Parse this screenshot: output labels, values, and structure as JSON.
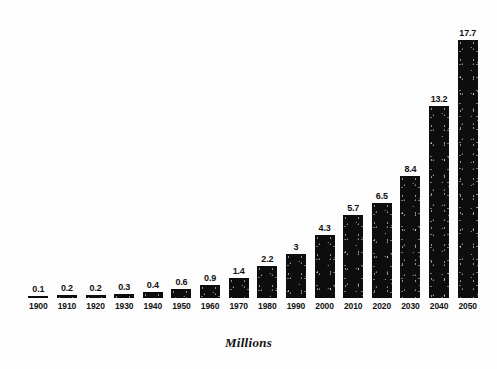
{
  "chart_data": {
    "type": "bar",
    "title": "",
    "subtitle": "",
    "xlabel": "",
    "ylabel": "Millions",
    "caption": "Millions",
    "grid": false,
    "legend": "none",
    "ylim": [
      0,
      18
    ],
    "xlim_categories": 16,
    "bar_color": "#0d0d0d",
    "background_color": "#ffffff",
    "categories": [
      "1900",
      "1910",
      "1920",
      "1930",
      "1940",
      "1950",
      "1960",
      "1970",
      "1980",
      "1990",
      "2000",
      "2010",
      "2020",
      "2030",
      "2040",
      "2050"
    ],
    "values": [
      0.1,
      0.2,
      0.2,
      0.3,
      0.4,
      0.6,
      0.9,
      1.4,
      2.2,
      3,
      4.3,
      5.7,
      6.5,
      8.4,
      13.2,
      17.7
    ],
    "value_labels": [
      "0.1",
      "0.2",
      "0.2",
      "0.3",
      "0.4",
      "0.6",
      "0.9",
      "1.4",
      "2.2",
      "3",
      "4.3",
      "5.7",
      "6.5",
      "8.4",
      "13.2",
      "17.7"
    ],
    "bars": [
      {
        "category": "1900",
        "value": 0.1,
        "label": "0.1"
      },
      {
        "category": "1910",
        "value": 0.2,
        "label": "0.2"
      },
      {
        "category": "1920",
        "value": 0.2,
        "label": "0.2"
      },
      {
        "category": "1930",
        "value": 0.3,
        "label": "0.3"
      },
      {
        "category": "1940",
        "value": 0.4,
        "label": "0.4"
      },
      {
        "category": "1950",
        "value": 0.6,
        "label": "0.6"
      },
      {
        "category": "1960",
        "value": 0.9,
        "label": "0.9"
      },
      {
        "category": "1970",
        "value": 1.4,
        "label": "1.4"
      },
      {
        "category": "1980",
        "value": 2.2,
        "label": "2.2"
      },
      {
        "category": "1990",
        "value": 3,
        "label": "3"
      },
      {
        "category": "2000",
        "value": 4.3,
        "label": "4.3"
      },
      {
        "category": "2010",
        "value": 5.7,
        "label": "5.7"
      },
      {
        "category": "2020",
        "value": 6.5,
        "label": "6.5"
      },
      {
        "category": "2030",
        "value": 8.4,
        "label": "8.4"
      },
      {
        "category": "2040",
        "value": 13.2,
        "label": "13.2"
      },
      {
        "category": "2050",
        "value": 17.7,
        "label": "17.7"
      }
    ]
  },
  "layout": {
    "plot_left": 24,
    "plot_right": 482,
    "baseline_y": 298,
    "px_per_unit": 14.55,
    "bar_width": 20,
    "slot_width": 28.6
  }
}
